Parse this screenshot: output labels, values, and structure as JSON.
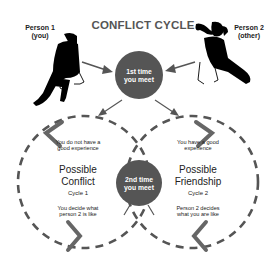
{
  "title": "CONFLICT CYCLE",
  "person1": {
    "line1": "Person 1",
    "line2": "(you)"
  },
  "person2": {
    "line1": "Person 2",
    "line2": "(other)"
  },
  "node_first": {
    "line1": "1st time",
    "line2": "you meet"
  },
  "node_second": {
    "line1": "2nd time",
    "line2": "you meet"
  },
  "cycle_left": {
    "top_text1": "You do not have a",
    "top_text2": "good experience",
    "title1": "Possible",
    "title2": "Conflict",
    "cycle": "Cycle 1",
    "bottom_text1": "You decide what",
    "bottom_text2": "person 2 is like"
  },
  "cycle_right": {
    "top_text1": "You have a good",
    "top_text2": "experience",
    "title1": "Possible",
    "title2": "Friendship",
    "cycle": "Cycle 2",
    "bottom_text1": "Person 2 decides",
    "bottom_text2": "what you are like"
  },
  "colors": {
    "node": "#555555",
    "chevron": "#555555",
    "dash": "#555555",
    "figure": "#000000"
  }
}
